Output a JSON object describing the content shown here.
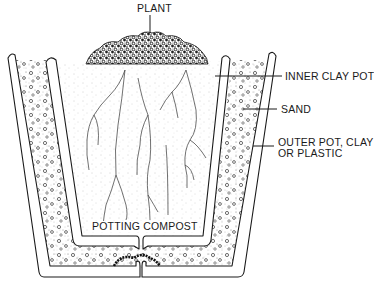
{
  "diagram": {
    "type": "cross-section illustration",
    "colors": {
      "ink": "#1a1a1a",
      "background": "#ffffff",
      "stipple": "#8a8a8a"
    },
    "labels": {
      "plant": "PLANT",
      "inner_pot": "INNER CLAY POT",
      "sand": "SAND",
      "outer_pot_line1": "OUTER POT, CLAY",
      "outer_pot_line2": "OR PLASTIC",
      "compost": "POTTING COMPOST"
    },
    "components": [
      {
        "id": "plant",
        "label": "PLANT"
      },
      {
        "id": "inner-clay-pot",
        "label": "INNER CLAY POT"
      },
      {
        "id": "sand",
        "label": "SAND"
      },
      {
        "id": "outer-pot",
        "label": "OUTER POT, CLAY OR PLASTIC"
      },
      {
        "id": "potting-compost",
        "label": "POTTING COMPOST"
      }
    ]
  }
}
